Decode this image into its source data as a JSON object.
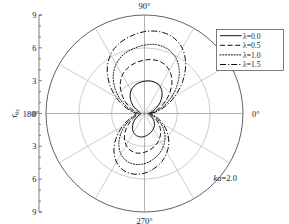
{
  "chart_data": {
    "type": "line",
    "projection": "polar",
    "title": "",
    "xlabel": "",
    "ylabel": "τ̄θz",
    "ylabel_parts": {
      "base": "τ̄",
      "sub": "θz"
    },
    "annotation": "ka=2.0",
    "annotation_parts": {
      "italic": "ka",
      "rest": "=2.0"
    },
    "rlim": [
      0,
      9
    ],
    "r_ticks": [
      3,
      6,
      9
    ],
    "grid": true,
    "angle_ticks_deg": [
      0,
      90,
      180,
      270
    ],
    "angle_tick_labels": [
      "0°",
      "90°",
      "180°",
      "270°"
    ],
    "radial_axis_tick_labels": [
      "9",
      "6",
      "3",
      "0",
      "3",
      "6",
      "9"
    ],
    "radial_axis_tick_values": [
      9,
      6,
      3,
      0,
      3,
      6,
      9
    ],
    "spoke_interval_deg": 30,
    "legend_position": "upper right",
    "series": [
      {
        "name": "λ=0.0",
        "dash": "none",
        "theta_deg": [
          0,
          10,
          20,
          30,
          40,
          50,
          60,
          70,
          80,
          90,
          100,
          110,
          120,
          130,
          140,
          150,
          160,
          170,
          180,
          190,
          200,
          210,
          220,
          230,
          240,
          250,
          260,
          270,
          280,
          290,
          300,
          310,
          320,
          330,
          340,
          350
        ],
        "values": [
          0.3,
          0.55,
          0.95,
          1.45,
          2.0,
          2.5,
          2.85,
          3.0,
          3.02,
          2.95,
          2.85,
          2.7,
          2.45,
          2.05,
          1.55,
          1.05,
          0.65,
          0.4,
          0.3,
          0.4,
          0.62,
          0.95,
          1.35,
          1.72,
          2.0,
          2.15,
          2.18,
          2.1,
          1.95,
          1.8,
          1.62,
          1.42,
          1.15,
          0.85,
          0.58,
          0.38
        ]
      },
      {
        "name": "λ=0.5",
        "dash": "dashed",
        "theta_deg": [
          0,
          10,
          20,
          30,
          40,
          50,
          60,
          70,
          80,
          90,
          100,
          110,
          120,
          130,
          140,
          150,
          160,
          170,
          180,
          190,
          200,
          210,
          220,
          230,
          240,
          250,
          260,
          270,
          280,
          290,
          300,
          310,
          320,
          330,
          340,
          350
        ],
        "values": [
          0.45,
          0.85,
          1.45,
          2.2,
          3.05,
          3.9,
          4.55,
          4.9,
          4.98,
          4.88,
          4.7,
          4.45,
          4.05,
          3.45,
          2.7,
          1.95,
          1.3,
          0.8,
          0.52,
          0.62,
          0.98,
          1.52,
          2.2,
          2.85,
          3.35,
          3.62,
          3.68,
          3.55,
          3.32,
          3.05,
          2.7,
          2.3,
          1.82,
          1.32,
          0.88,
          0.58
        ]
      },
      {
        "name": "λ=1.0",
        "dash": "dotted",
        "theta_deg": [
          0,
          10,
          20,
          30,
          40,
          50,
          60,
          70,
          80,
          90,
          100,
          110,
          120,
          130,
          140,
          150,
          160,
          170,
          180,
          190,
          200,
          210,
          220,
          230,
          240,
          250,
          260,
          270,
          280,
          290,
          300,
          310,
          320,
          330,
          340,
          350
        ],
        "values": [
          0.55,
          1.05,
          1.8,
          2.75,
          3.85,
          4.95,
          5.8,
          6.25,
          6.38,
          6.25,
          6.0,
          5.7,
          5.2,
          4.45,
          3.5,
          2.55,
          1.7,
          1.05,
          0.68,
          0.8,
          1.25,
          1.95,
          2.8,
          3.65,
          4.3,
          4.65,
          4.72,
          4.58,
          4.28,
          3.92,
          3.45,
          2.92,
          2.3,
          1.68,
          1.12,
          0.72
        ]
      },
      {
        "name": "λ=1.5",
        "dash": "dashdot",
        "theta_deg": [
          0,
          10,
          20,
          30,
          40,
          50,
          60,
          70,
          80,
          90,
          100,
          110,
          120,
          130,
          140,
          150,
          160,
          170,
          180,
          190,
          200,
          210,
          220,
          230,
          240,
          250,
          260,
          270,
          280,
          290,
          300,
          310,
          320,
          330,
          340,
          350
        ],
        "values": [
          0.62,
          1.22,
          2.1,
          3.25,
          4.55,
          5.85,
          6.9,
          7.45,
          7.6,
          7.48,
          7.18,
          6.8,
          6.2,
          5.3,
          4.18,
          3.02,
          2.02,
          1.25,
          0.8,
          0.95,
          1.48,
          2.32,
          3.35,
          4.35,
          5.12,
          5.55,
          5.62,
          5.45,
          5.1,
          4.66,
          4.1,
          3.46,
          2.72,
          1.98,
          1.32,
          0.85
        ]
      }
    ]
  },
  "legend": {
    "entries": [
      {
        "label": "λ=0.0",
        "dash": "none"
      },
      {
        "label": "λ=0.5",
        "dash": "dashed"
      },
      {
        "label": "λ=1.0",
        "dash": "dotted"
      },
      {
        "label": "λ=1.5",
        "dash": "dashdot"
      }
    ]
  }
}
